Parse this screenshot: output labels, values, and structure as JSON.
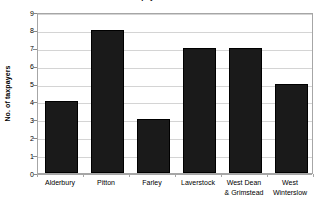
{
  "chart_data": {
    "type": "bar",
    "title": "Taxpayers in 1576",
    "title_cropped": true,
    "categories": [
      "Alderbury",
      "Pitton",
      "Farley",
      "Laverstock",
      "West Dean & Grimstead",
      "West Winterslow"
    ],
    "category_lines": [
      [
        "Alderbury"
      ],
      [
        "Pitton"
      ],
      [
        "Farley"
      ],
      [
        "Laverstock"
      ],
      [
        "West Dean",
        "& Grimstead"
      ],
      [
        "West",
        "Winterslow"
      ]
    ],
    "values": [
      4,
      8,
      3,
      7,
      7,
      5
    ],
    "xlabel": "",
    "ylabel": "No. of taxpayers",
    "ylim": [
      0,
      9
    ],
    "ytick_labels": [
      "0",
      "1",
      "2",
      "3",
      "4",
      "5",
      "6",
      "7",
      "8",
      "9"
    ],
    "ytick_values": [
      0,
      1,
      2,
      3,
      4,
      5,
      6,
      7,
      8,
      9
    ],
    "grid": true,
    "grid_axis": "y",
    "legend": false,
    "series_color": "#1a1a1a",
    "gridline_color": "#d4d4d4",
    "axis_color": "#a6a6a6",
    "background_color": "#ffffff"
  }
}
